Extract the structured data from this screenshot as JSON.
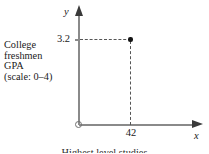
{
  "figure": {
    "background_color": "#ffffff",
    "axis_color": "#8a8a8a",
    "ink_color": "#1a1a1a",
    "guide_color": "#555555",
    "point_color": "#141414"
  },
  "axes": {
    "y_name": "y",
    "x_name": "x",
    "y_caption_lines": [
      "College",
      "freshmen",
      "GPA",
      "(scale: 0–4)"
    ],
    "y_caption_text": "College freshmen GPA (scale: 0–4)",
    "y_ticks": [
      {
        "label": "3.2",
        "value": 3.2
      }
    ],
    "x_ticks": [
      {
        "label": "42",
        "value": 42
      }
    ],
    "origin_label": "O"
  },
  "bottom_caption": {
    "text": "Highest level studies"
  },
  "chart_data": {
    "type": "scatter",
    "title": "",
    "subtitle": "",
    "xlabel": "x",
    "ylabel": "y",
    "y_axis_description": "College freshmen GPA (scale: 0–4)",
    "x": [
      42
    ],
    "y": [
      3.2
    ],
    "points": [
      {
        "x": 42,
        "y": 3.2,
        "x_label": "42",
        "y_label": "3.2"
      }
    ],
    "xlim": [
      0,
      70
    ],
    "ylim": [
      0,
      4
    ],
    "xticks": [
      42
    ],
    "xticklabels": [
      "42"
    ],
    "yticks": [
      3.2
    ],
    "yticklabels": [
      "3.2"
    ],
    "grid": false,
    "legend": null,
    "annotations": [
      {
        "type": "dashed-guide",
        "orientation": "horizontal",
        "from": "y-axis at 3.2",
        "to": "point (42, 3.2)"
      },
      {
        "type": "dashed-guide",
        "orientation": "vertical",
        "from": "point (42, 3.2)",
        "to": "x-axis at 42"
      }
    ]
  }
}
